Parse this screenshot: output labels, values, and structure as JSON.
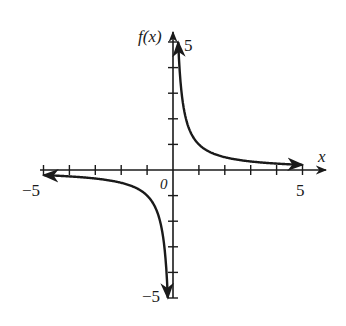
{
  "chart_data": {
    "type": "line",
    "title": "",
    "function": "f(x) = 1/x",
    "xlabel": "x",
    "ylabel": "f(x)",
    "xlim": [
      -5,
      5
    ],
    "ylim": [
      -5,
      5
    ],
    "grid": false,
    "legend": null,
    "x_tick_labels": [
      "-5",
      "0",
      "5"
    ],
    "y_tick_labels": [
      "5",
      "-5"
    ],
    "x_ticks": [
      -5,
      -4,
      -3,
      -2,
      -1,
      1,
      2,
      3,
      4,
      5
    ],
    "y_ticks": [
      -5,
      -4,
      -3,
      -2,
      -1,
      1,
      2,
      3,
      4,
      5
    ],
    "series": [
      {
        "name": "f(x) left branch",
        "x": [
          -5,
          -4,
          -3,
          -2,
          -1.5,
          -1,
          -0.75,
          -0.5,
          -0.4,
          -0.3,
          -0.25,
          -0.2
        ],
        "y": [
          -0.2,
          -0.25,
          -0.333,
          -0.5,
          -0.667,
          -1,
          -1.333,
          -2,
          -2.5,
          -3.333,
          -4,
          -5
        ]
      },
      {
        "name": "f(x) right branch",
        "x": [
          0.2,
          0.25,
          0.3,
          0.4,
          0.5,
          0.75,
          1,
          1.5,
          2,
          3,
          4,
          5
        ],
        "y": [
          5,
          4,
          3.333,
          2.5,
          2,
          1.333,
          1,
          0.667,
          0.5,
          0.333,
          0.25,
          0.2
        ]
      }
    ],
    "asymptotes": {
      "vertical": 0,
      "horizontal": 0
    }
  },
  "labels": {
    "x_axis": "x",
    "y_axis": "f(x)",
    "x_min": "−5",
    "x_max": "5",
    "y_max": "5",
    "y_min": "−5",
    "origin": "0"
  },
  "colors": {
    "ink": "#1a1a1a",
    "background": "#ffffff"
  }
}
